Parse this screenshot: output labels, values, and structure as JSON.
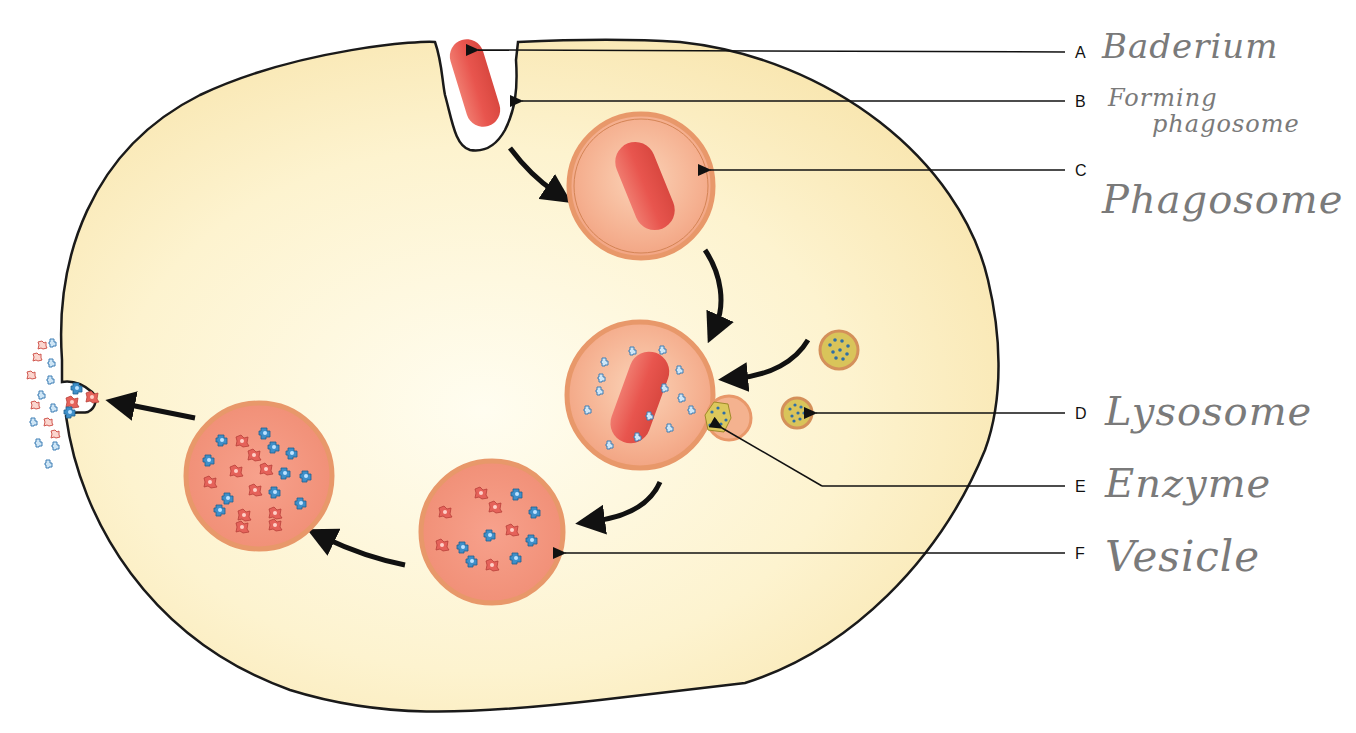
{
  "labels": [
    {
      "letter": "A",
      "text": "Baderium",
      "target": "bacterium"
    },
    {
      "letter": "B",
      "text": "Forming phagosome",
      "line1": "Forming",
      "line2": "phagosome",
      "target": "forming-phagosome"
    },
    {
      "letter": "C",
      "text": "Phagosome",
      "target": "phagosome"
    },
    {
      "letter": "D",
      "text": "Lysosome",
      "target": "lysosome"
    },
    {
      "letter": "E",
      "text": "Enzyme",
      "target": "enzyme"
    },
    {
      "letter": "F",
      "text": "Vesicle",
      "target": "vesicle"
    }
  ],
  "stages": [
    "bacterium engulfed",
    "phagosome formed",
    "lysosome fuses with phagosome",
    "bacterium digested in vesicle",
    "residual vesicle",
    "exocytosis of debris"
  ],
  "colors": {
    "cytoplasm": "#fbeec0",
    "membrane": "#1a1a1a",
    "bacterium": "#e8554e",
    "phagosome_fill": "#f4a58a",
    "phagosome_rim": "#e49a6a",
    "lysosome_fill": "#d9c45a",
    "enzyme_blue": "#3f8fc9",
    "fragment_red": "#e5625a"
  }
}
